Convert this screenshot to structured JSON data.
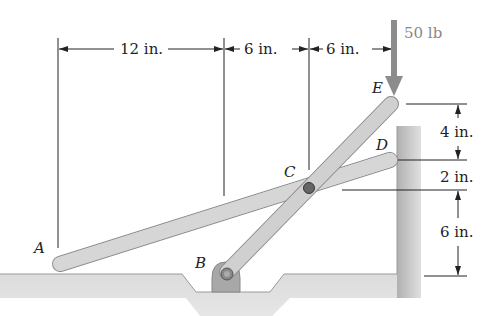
{
  "figure": {
    "points": {
      "A": "A",
      "B": "B",
      "C": "C",
      "D": "D",
      "E": "E"
    },
    "load": {
      "label": "50 lb",
      "direction": "down",
      "applied_at": "E"
    },
    "horizontal_dimensions": [
      {
        "label": "12 in.",
        "from": "A",
        "to": "B"
      },
      {
        "label": "6 in.",
        "from": "B",
        "to": "C"
      },
      {
        "label": "6 in.",
        "from": "C",
        "to": "E"
      }
    ],
    "vertical_dimensions": [
      {
        "label": "4 in.",
        "from": "E",
        "to": "D"
      },
      {
        "label": "2 in.",
        "from": "D",
        "to": "C"
      },
      {
        "label": "6 in.",
        "from": "C",
        "to": "ground"
      }
    ],
    "colors": {
      "bar_fill": "#c8c8c8",
      "bar_edge": "#8a8a8a",
      "ground_fill": "#c4c4c4",
      "force_arrow": "#8c8c8c",
      "text": "#222222"
    }
  }
}
